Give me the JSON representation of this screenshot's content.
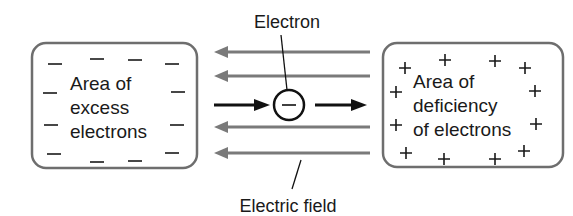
{
  "diagram": {
    "left_region": {
      "label_lines": [
        "Area of",
        "excess",
        "electrons"
      ],
      "charge_symbol": "—",
      "charge_count": 14
    },
    "right_region": {
      "label_lines": [
        "Area of",
        "deficiency",
        "of electrons"
      ],
      "charge_symbol": "+",
      "charge_count": 14
    },
    "electron": {
      "label": "Electron",
      "symbol": "−"
    },
    "field": {
      "label": "Electric field",
      "line_count": 4,
      "direction": "right-to-left"
    },
    "electron_motion_direction": "left-to-right",
    "colors": {
      "box_stroke": "#6e6e6e",
      "field_lines": "#7a7a7a",
      "electron_arrows": "#111111",
      "text": "#1a1a1a"
    }
  }
}
